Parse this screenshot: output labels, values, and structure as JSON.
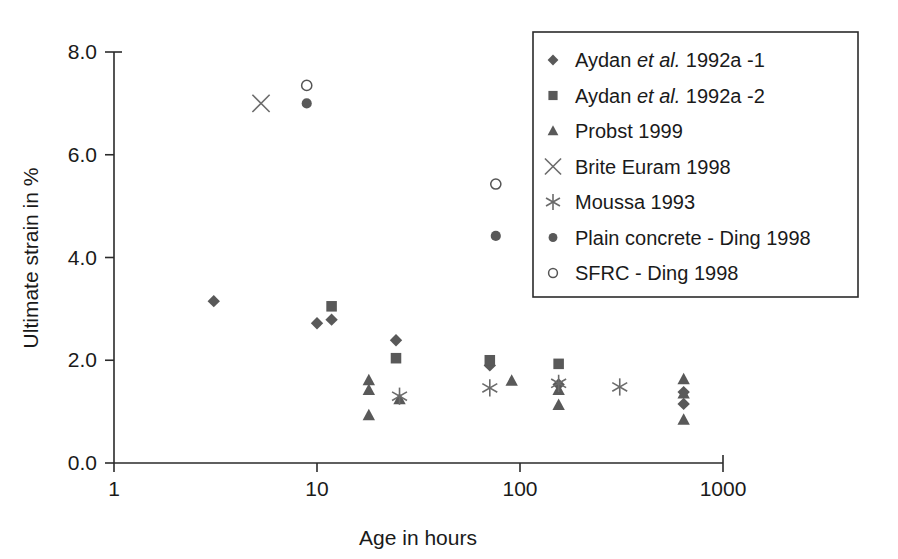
{
  "chart_data": {
    "type": "scatter",
    "title": "",
    "xlabel": "Age in hours",
    "ylabel": "Ultimate strain in %",
    "xscale": "log",
    "yscale": "linear",
    "xlim": [
      1,
      1000
    ],
    "ylim": [
      0.0,
      8.0
    ],
    "xticks": [
      1,
      10,
      100,
      1000
    ],
    "xticklabels": [
      "1",
      "10",
      "100",
      "1000"
    ],
    "yticks": [
      0.0,
      2.0,
      4.0,
      6.0,
      8.0
    ],
    "yticklabels": [
      "0.0",
      "2.0",
      "4.0",
      "6.0",
      "8.0"
    ],
    "grid": false,
    "legend_position": "top-right",
    "series": [
      {
        "name": "Aydan et al. 1992a -1",
        "label_parts": [
          "Aydan ",
          "et al.",
          " 1992a -1"
        ],
        "marker": "diamond",
        "filled": true,
        "color": "#595959",
        "points": [
          {
            "x": 3.1,
            "y": 3.15
          },
          {
            "x": 10.0,
            "y": 2.72
          },
          {
            "x": 11.8,
            "y": 2.79
          },
          {
            "x": 24.5,
            "y": 2.39
          },
          {
            "x": 71.0,
            "y": 1.9
          },
          {
            "x": 155.0,
            "y": 1.53
          },
          {
            "x": 640.0,
            "y": 1.38
          },
          {
            "x": 640.0,
            "y": 1.15
          }
        ]
      },
      {
        "name": "Aydan et al. 1992a -2",
        "label_parts": [
          "Aydan ",
          "et al.",
          " 1992a -2"
        ],
        "marker": "square",
        "filled": true,
        "color": "#595959",
        "points": [
          {
            "x": 11.8,
            "y": 3.05
          },
          {
            "x": 24.5,
            "y": 2.04
          },
          {
            "x": 71.0,
            "y": 2.0
          },
          {
            "x": 155.0,
            "y": 1.93
          }
        ]
      },
      {
        "name": "Probst 1999",
        "marker": "triangle",
        "filled": true,
        "color": "#595959",
        "points": [
          {
            "x": 18.0,
            "y": 1.61
          },
          {
            "x": 18.0,
            "y": 1.42
          },
          {
            "x": 18.0,
            "y": 0.93
          },
          {
            "x": 25.5,
            "y": 1.24
          },
          {
            "x": 91.0,
            "y": 1.6
          },
          {
            "x": 155.0,
            "y": 1.42
          },
          {
            "x": 155.0,
            "y": 1.13
          },
          {
            "x": 640.0,
            "y": 1.63
          },
          {
            "x": 640.0,
            "y": 1.35
          },
          {
            "x": 640.0,
            "y": 0.84
          }
        ]
      },
      {
        "name": "Brite Euram 1998",
        "marker": "cross",
        "filled": false,
        "color": "#6b6b6b",
        "points": [
          {
            "x": 5.3,
            "y": 7.0
          }
        ]
      },
      {
        "name": "Moussa 1993",
        "marker": "asterisk",
        "filled": false,
        "color": "#6b6b6b",
        "points": [
          {
            "x": 25.5,
            "y": 1.3
          },
          {
            "x": 71.0,
            "y": 1.46
          },
          {
            "x": 155.0,
            "y": 1.55
          },
          {
            "x": 310.0,
            "y": 1.48
          }
        ]
      },
      {
        "name": "Plain concrete - Ding 1998",
        "marker": "circle",
        "filled": true,
        "color": "#595959",
        "points": [
          {
            "x": 8.9,
            "y": 7.0
          },
          {
            "x": 76.0,
            "y": 4.42
          }
        ]
      },
      {
        "name": "SFRC - Ding 1998",
        "marker": "circle",
        "filled": false,
        "color": "#555555",
        "points": [
          {
            "x": 8.9,
            "y": 7.35
          },
          {
            "x": 76.0,
            "y": 5.43
          }
        ]
      }
    ]
  }
}
